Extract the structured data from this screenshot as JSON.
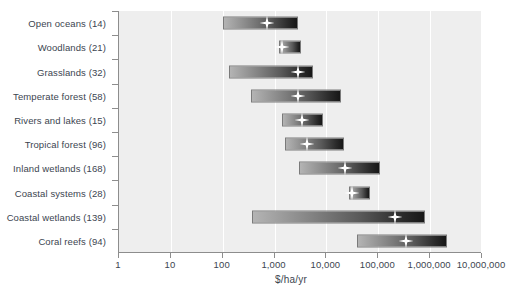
{
  "chart_data": {
    "type": "bar",
    "subtype": "floating-range-bar-with-median-marker",
    "title": "",
    "xlabel": "$/ha/yr",
    "ylabel": "",
    "xscale": "log",
    "xlim": [
      1,
      10000000
    ],
    "grid": "vertical",
    "legend": "none",
    "marker_symbol": "four-pointed-star",
    "marker_label": "median",
    "xticks": [
      1,
      10,
      100,
      1000,
      10000,
      100000,
      1000000,
      10000000
    ],
    "xticklabels": [
      "1",
      "10",
      "100",
      "1,000",
      "10,000",
      "100,000",
      "1,000,000",
      "10,000,000"
    ],
    "categories": [
      "Open oceans (14)",
      "Woodlands (21)",
      "Grasslands (32)",
      "Temperate forest (58)",
      "Rivers and lakes (15)",
      "Tropical forest (96)",
      "Inland wetlands (168)",
      "Coastal systems (28)",
      "Coastal wetlands (139)",
      "Coral reefs (94)"
    ],
    "rows": [
      {
        "label": "Open oceans (14)",
        "n": 14,
        "low": 100,
        "high": 2800,
        "median": 700
      },
      {
        "label": "Woodlands (21)",
        "n": 21,
        "low": 1200,
        "high": 3200,
        "median": 1400
      },
      {
        "label": "Grasslands (32)",
        "n": 32,
        "low": 130,
        "high": 5500,
        "median": 2800
      },
      {
        "label": "Temperate forest (58)",
        "n": 58,
        "low": 350,
        "high": 19000,
        "median": 2800
      },
      {
        "label": "Rivers and lakes (15)",
        "n": 15,
        "low": 1400,
        "high": 8700,
        "median": 3400
      },
      {
        "label": "Tropical forest (96)",
        "n": 96,
        "low": 1600,
        "high": 22000,
        "median": 4300
      },
      {
        "label": "Inland wetlands (168)",
        "n": 168,
        "low": 2900,
        "high": 110000,
        "median": 23000
      },
      {
        "label": "Coastal systems (28)",
        "n": 28,
        "low": 27000,
        "high": 70000,
        "median": 31000
      },
      {
        "label": "Coastal wetlands (139)",
        "n": 139,
        "low": 370,
        "high": 800000,
        "median": 210000
      },
      {
        "label": "Coral reefs (94)",
        "n": 94,
        "low": 38000,
        "high": 2100000,
        "median": 340000
      }
    ],
    "colors": {
      "plot_background": "#eeeeee",
      "gridline": "#ffffff",
      "axis": "#8d8d8d",
      "text": "#3c4550",
      "bar_gradient_start": "#b4b4b4",
      "bar_gradient_end": "#171717",
      "marker": "#ffffff"
    }
  }
}
